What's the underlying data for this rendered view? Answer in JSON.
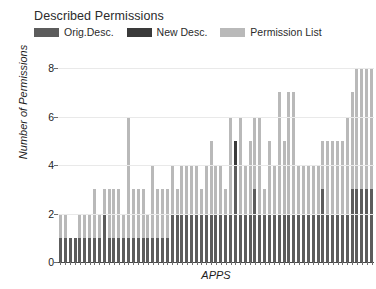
{
  "legend": {
    "title": "Described Permissions",
    "items": [
      {
        "label": "Orig.Desc.",
        "color": "#5c5c5c"
      },
      {
        "label": "New Desc.",
        "color": "#3a3a3a"
      },
      {
        "label": "Permission List",
        "color": "#b9b9b9"
      }
    ]
  },
  "axes": {
    "ylabel": "Number of Permissions",
    "xlabel": "APPS",
    "yticks": [
      "0",
      "2",
      "4",
      "6",
      "8"
    ]
  },
  "chart_data": {
    "type": "bar",
    "subtype": "stacked",
    "title": "Described Permissions",
    "xlabel": "APPS",
    "ylabel": "Number of Permissions",
    "ylim": [
      0,
      8
    ],
    "yticks": [
      0,
      2,
      4,
      6,
      8
    ],
    "grid": true,
    "legend_position": "top-left",
    "xtick_labels": [],
    "series": [
      {
        "name": "Orig.Desc.",
        "color": "#5c5c5c",
        "values": [
          1,
          1,
          1,
          1,
          1,
          1,
          1,
          1,
          1,
          2,
          1,
          1,
          1,
          1,
          1,
          1,
          1,
          1,
          1,
          1,
          1,
          1,
          1,
          2,
          2,
          2,
          2,
          2,
          2,
          2,
          2,
          2,
          2,
          2,
          2,
          2,
          4,
          2,
          2,
          2,
          3,
          2,
          2,
          2,
          2,
          2,
          2,
          2,
          2,
          2,
          2,
          2,
          2,
          2,
          3,
          2,
          2,
          2,
          2,
          2,
          3,
          3,
          3,
          3,
          3
        ]
      },
      {
        "name": "New Desc.",
        "color": "#3a3a3a",
        "values": [
          0,
          0,
          0,
          0,
          0,
          0,
          0,
          0,
          0,
          0,
          0,
          0,
          0,
          0,
          0,
          0,
          0,
          0,
          0,
          0,
          0,
          0,
          0,
          0,
          0,
          0,
          0,
          0,
          0,
          0,
          0,
          0,
          0,
          0,
          0,
          0,
          1,
          0,
          0,
          0,
          0,
          0,
          0,
          0,
          0,
          0,
          0,
          0,
          0,
          0,
          0,
          0,
          0,
          0,
          0,
          0,
          0,
          0,
          0,
          0,
          0,
          0,
          0,
          0,
          0
        ]
      },
      {
        "name": "Permission List",
        "color": "#b9b9b9",
        "values": [
          1,
          1,
          0,
          0,
          1,
          1,
          1,
          2,
          1,
          1,
          2,
          2,
          2,
          1,
          5,
          2,
          2,
          2,
          1,
          3,
          2,
          2,
          2,
          2,
          1,
          2,
          2,
          2,
          2,
          1,
          2,
          3,
          2,
          2,
          1,
          4,
          0,
          4,
          2,
          3,
          3,
          4,
          1,
          3,
          2,
          5,
          3,
          5,
          5,
          2,
          2,
          2,
          2,
          2,
          2,
          3,
          3,
          3,
          3,
          4,
          4,
          5,
          5,
          5,
          5
        ]
      }
    ],
    "totals": [
      2,
      2,
      1,
      1,
      2,
      2,
      2,
      3,
      2,
      3,
      3,
      3,
      3,
      2,
      6,
      3,
      3,
      3,
      2,
      4,
      3,
      3,
      3,
      4,
      3,
      4,
      4,
      4,
      4,
      3,
      4,
      5,
      4,
      4,
      3,
      6,
      5,
      6,
      4,
      5,
      6,
      6,
      3,
      5,
      4,
      7,
      5,
      7,
      7,
      4,
      4,
      4,
      4,
      4,
      5,
      5,
      5,
      5,
      5,
      6,
      7,
      8,
      8,
      8,
      8
    ]
  }
}
